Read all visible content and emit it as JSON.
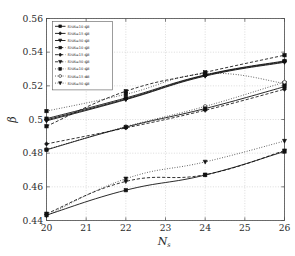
{
  "chart_data": {
    "type": "line",
    "title": "",
    "subtitle": "",
    "xlabel": "N_s",
    "xlabel_base": "N",
    "xlabel_sub": "s",
    "ylabel": "β",
    "xlim": [
      20,
      26
    ],
    "ylim": [
      0.44,
      0.56
    ],
    "xticks": [
      20,
      21,
      22,
      23,
      24,
      25,
      26
    ],
    "xtick_labels": [
      "20",
      "21",
      "22",
      "23",
      "24",
      "25",
      "26"
    ],
    "yticks": [
      0.44,
      0.46,
      0.48,
      0.5,
      0.52,
      0.54,
      0.56
    ],
    "ytick_labels": [
      "0.44",
      "0.46",
      "0.48",
      "0.5",
      "0.52",
      "0.54",
      "0.56"
    ],
    "grid": true,
    "grid_style": "dotted",
    "legend_position": "upper-left",
    "x": [
      20,
      22,
      24,
      26
    ],
    "series": [
      {
        "name": "SNR=10 dBβ₁",
        "label_base": "SNR=10 dB",
        "label_sub": "1",
        "linestyle": "solid",
        "marker": "square-filled",
        "values": [
          0.5005,
          0.5128,
          0.5265,
          0.5348
        ]
      },
      {
        "name": "SNR=15 dBβ₁",
        "label_base": "SNR=15 dB",
        "label_sub": "1",
        "linestyle": "solid",
        "marker": "diamond-filled",
        "values": [
          0.4998,
          0.5122,
          0.5262,
          0.5344
        ]
      },
      {
        "name": "SNR=50 dBβ₁",
        "label_base": "SNR=50 dB",
        "label_sub": "1",
        "linestyle": "solid",
        "marker": "triangle-down-filled",
        "values": [
          0.4992,
          0.5118,
          0.5258,
          0.534
        ]
      },
      {
        "name": "SNR=10 dBβ₂",
        "label_base": "SNR=10 dB",
        "label_sub": "2",
        "linestyle": "dashed",
        "marker": "square-filled",
        "values": [
          0.496,
          0.5168,
          0.528,
          0.5382
        ]
      },
      {
        "name": "SNR=15 dBβ₂",
        "label_base": "SNR=15 dB",
        "label_sub": "2",
        "linestyle": "dashed",
        "marker": "diamond-filled",
        "values": [
          0.4855,
          0.495,
          0.5055,
          0.518
        ]
      },
      {
        "name": "SNR=50 dBβ₂",
        "label_base": "SNR=50 dB",
        "label_sub": "2",
        "linestyle": "dashed",
        "marker": "triangle-down-filled",
        "values": [
          0.444,
          0.4632,
          0.4672,
          0.4815
        ]
      },
      {
        "name": "SNR=10 dBβ₃",
        "label_base": "SNR=10 dB",
        "label_sub": "3",
        "linestyle": "dotted",
        "marker": "square-filled",
        "values": [
          0.505,
          0.515,
          0.5272,
          0.5215
        ]
      },
      {
        "name": "SNR=15 dBβ₃",
        "label_base": "SNR=15 dB",
        "label_sub": "3",
        "linestyle": "dotted",
        "marker": "circle-open",
        "values": [
          0.4822,
          0.4958,
          0.5078,
          0.5222
        ]
      },
      {
        "name": "SNR=50 dBβ₃",
        "label_base": "SNR=50 dB",
        "label_sub": "3",
        "linestyle": "dotted",
        "marker": "triangle-down-filled",
        "values": [
          0.4428,
          0.4648,
          0.4748,
          0.4872
        ]
      }
    ],
    "extra_series": [
      {
        "name": "solid-lower-band",
        "linestyle": "solid",
        "marker": "square-filled",
        "values": [
          0.482,
          0.4955,
          0.5065,
          0.5195
        ]
      },
      {
        "name": "solid-bottom-band",
        "linestyle": "solid",
        "marker": "square-filled",
        "values": [
          0.4432,
          0.458,
          0.467,
          0.481
        ]
      }
    ]
  },
  "legend": {
    "entries": [
      {
        "base": "SNR=10 dB",
        "sub": "1",
        "style": "solid",
        "marker": "square-filled"
      },
      {
        "base": "SNR=15 dB",
        "sub": "1",
        "style": "solid",
        "marker": "diamond-filled"
      },
      {
        "base": "SNR=50 dB",
        "sub": "1",
        "style": "solid",
        "marker": "triangle-down-filled"
      },
      {
        "base": "SNR=10 dB",
        "sub": "2",
        "style": "dashed",
        "marker": "square-filled"
      },
      {
        "base": "SNR=15 dB",
        "sub": "2",
        "style": "dashed",
        "marker": "diamond-filled"
      },
      {
        "base": "SNR=50 dB",
        "sub": "2",
        "style": "dashed",
        "marker": "triangle-down-filled"
      },
      {
        "base": "SNR=10 dB",
        "sub": "3",
        "style": "dotted",
        "marker": "square-filled"
      },
      {
        "base": "SNR=15 dB",
        "sub": "3",
        "style": "dotted",
        "marker": "circle-open"
      },
      {
        "base": "SNR=50 dB",
        "sub": "3",
        "style": "dotted",
        "marker": "triangle-down-filled"
      }
    ]
  },
  "colors": {
    "line": "#111111",
    "frame": "#4a4a4a",
    "grid": "#b9b9b9",
    "background": "#ffffff",
    "text": "#2b2b2b"
  }
}
